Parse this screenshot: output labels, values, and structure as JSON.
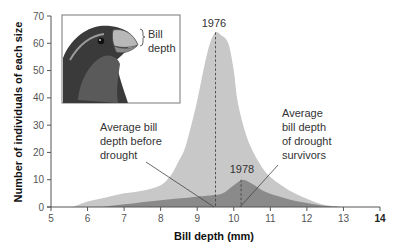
{
  "chart_data": {
    "type": "area",
    "title": "",
    "xlabel": "Bill depth (mm)",
    "ylabel": "Number of individuals of each size",
    "xlim": [
      5,
      14
    ],
    "ylim": [
      0,
      70
    ],
    "x_ticks": [
      5,
      6,
      7,
      8,
      9,
      10,
      11,
      12,
      13,
      14
    ],
    "y_ticks": [
      0,
      10,
      20,
      30,
      40,
      50,
      60,
      70
    ],
    "grid": false,
    "series": [
      {
        "name": "1976",
        "color": "#c8c8c8",
        "x": [
          5.6,
          6.0,
          6.5,
          7.0,
          7.5,
          8.0,
          8.3,
          8.5,
          8.65,
          8.8,
          9.0,
          9.2,
          9.35,
          9.5,
          9.65,
          9.85,
          10.0,
          10.1,
          10.3,
          10.5,
          10.8,
          11.0,
          11.3,
          11.6,
          12.0,
          12.4,
          12.9
        ],
        "values": [
          0,
          2,
          3.5,
          5,
          6,
          8,
          12,
          17,
          21,
          28,
          39,
          52,
          60,
          64,
          63,
          60,
          50,
          39,
          28,
          21,
          14,
          11,
          8,
          5.5,
          3,
          1,
          0
        ]
      },
      {
        "name": "1978",
        "color": "#8a8a8a",
        "x": [
          6.4,
          7.0,
          8.0,
          9.0,
          9.4,
          9.7,
          10.0,
          10.25,
          10.5,
          10.8,
          11.2,
          11.6,
          12.0,
          12.5,
          13.0
        ],
        "values": [
          0,
          1,
          2.5,
          3.8,
          4.3,
          5,
          8,
          10,
          8.5,
          6,
          4,
          2.5,
          1.5,
          0.5,
          0
        ]
      }
    ],
    "annotations": [
      {
        "text": "1976",
        "x": 9.5,
        "y": 66
      },
      {
        "text": "1978",
        "x": 10.25,
        "y": 12
      },
      {
        "text": "Average bill depth before drought",
        "lines": [
          "Average bill",
          "depth before",
          "drought"
        ],
        "points_to": 9.5
      },
      {
        "text": "Average bill depth of drought survivors",
        "lines": [
          "Average",
          "bill depth",
          "of drought",
          "survivors"
        ],
        "points_to": 10.2
      }
    ],
    "mean_lines": [
      {
        "label": "before drought",
        "x": 9.5
      },
      {
        "label": "drought survivors",
        "x": 10.2
      }
    ],
    "inset": {
      "label_lines": [
        "Bill",
        "depth"
      ],
      "description": "finch head illustration showing bill depth"
    }
  },
  "labels": {
    "xlabel": "Bill depth (mm)",
    "ylabel": "Number of individuals of each size",
    "year_1976": "1976",
    "year_1978": "1978",
    "before_1": "Average bill",
    "before_2": "depth before",
    "before_3": "drought",
    "after_1": "Average",
    "after_2": "bill depth",
    "after_3": "of drought",
    "after_4": "survivors",
    "inset_1": "Bill",
    "inset_2": "depth"
  }
}
